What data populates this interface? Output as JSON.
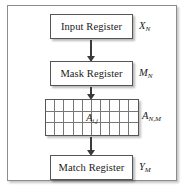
{
  "diagram": {
    "type": "block-diagram",
    "background_color": "#ffffff",
    "frame_border_color": "#8c8c8c",
    "box_border_color": "#555555",
    "arrow_color": "#3a3a3a",
    "grid_line_color": "#777777"
  },
  "blocks": [
    {
      "id": "input-register",
      "label": "Input Register",
      "symbol_base": "X",
      "symbol_sub": "N"
    },
    {
      "id": "mask-register",
      "label": "Mask Register",
      "symbol_base": "M",
      "symbol_sub": "N"
    },
    {
      "id": "memory-array",
      "label": "",
      "symbol_base": "A",
      "symbol_sub": "N,M"
    },
    {
      "id": "match-register",
      "label": "Match Register",
      "symbol_base": "Y",
      "symbol_sub": "M"
    }
  ],
  "array": {
    "columns": 10,
    "rows": 3,
    "cell_label_base": "A",
    "cell_label_sub": "i,j"
  },
  "arrows": [
    {
      "id": "arrow-input-to-mask",
      "from": "input-register",
      "to": "mask-register",
      "direction": "down"
    },
    {
      "id": "arrow-mask-to-array",
      "from": "mask-register",
      "to": "memory-array",
      "direction": "down"
    },
    {
      "id": "arrow-array-to-match",
      "from": "memory-array",
      "to": "match-register",
      "direction": "down"
    }
  ]
}
